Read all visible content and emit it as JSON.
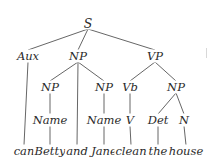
{
  "diagram": {
    "type": "syntax-tree",
    "sentence": "can Betty and Jane clean the house",
    "nodes": [
      {
        "id": "S",
        "label": "S",
        "x": 88,
        "y": 23,
        "kind": "root"
      },
      {
        "id": "Aux",
        "label": "Aux",
        "x": 28,
        "y": 56,
        "kind": "category"
      },
      {
        "id": "NP1",
        "label": "NP",
        "x": 78,
        "y": 56,
        "kind": "category"
      },
      {
        "id": "VP",
        "label": "VP",
        "x": 155,
        "y": 56,
        "kind": "category"
      },
      {
        "id": "NP2",
        "label": "NP",
        "x": 50,
        "y": 87,
        "kind": "category"
      },
      {
        "id": "NP3",
        "label": "NP",
        "x": 104,
        "y": 87,
        "kind": "category"
      },
      {
        "id": "Vb",
        "label": "Vb",
        "x": 130,
        "y": 87,
        "kind": "category"
      },
      {
        "id": "NP4",
        "label": "NP",
        "x": 176,
        "y": 87,
        "kind": "category"
      },
      {
        "id": "Name1",
        "label": "Name",
        "x": 50,
        "y": 120,
        "kind": "category"
      },
      {
        "id": "Name2",
        "label": "Name",
        "x": 104,
        "y": 120,
        "kind": "category"
      },
      {
        "id": "V",
        "label": "V",
        "x": 130,
        "y": 120,
        "kind": "category"
      },
      {
        "id": "Det",
        "label": "Det",
        "x": 158,
        "y": 120,
        "kind": "category"
      },
      {
        "id": "N",
        "label": "N",
        "x": 184,
        "y": 120,
        "kind": "category"
      },
      {
        "id": "w_can",
        "label": "can",
        "x": 24,
        "y": 151,
        "kind": "word"
      },
      {
        "id": "w_betty",
        "label": "Betty",
        "x": 50,
        "y": 151,
        "kind": "word"
      },
      {
        "id": "w_and",
        "label": "and",
        "x": 77,
        "y": 151,
        "kind": "word"
      },
      {
        "id": "w_jane",
        "label": "Jane",
        "x": 104,
        "y": 151,
        "kind": "word"
      },
      {
        "id": "w_clean",
        "label": "clean",
        "x": 131,
        "y": 151,
        "kind": "word"
      },
      {
        "id": "w_the",
        "label": "the",
        "x": 158,
        "y": 151,
        "kind": "word"
      },
      {
        "id": "w_house",
        "label": "house",
        "x": 186,
        "y": 151,
        "kind": "word"
      }
    ],
    "edges": [
      {
        "from": "S",
        "to": "Aux"
      },
      {
        "from": "S",
        "to": "NP1"
      },
      {
        "from": "S",
        "to": "VP"
      },
      {
        "from": "Aux",
        "to": "w_can"
      },
      {
        "from": "NP1",
        "to": "NP2"
      },
      {
        "from": "NP1",
        "to": "w_and"
      },
      {
        "from": "NP1",
        "to": "NP3"
      },
      {
        "from": "VP",
        "to": "Vb"
      },
      {
        "from": "VP",
        "to": "NP4"
      },
      {
        "from": "NP2",
        "to": "Name1"
      },
      {
        "from": "NP3",
        "to": "Name2"
      },
      {
        "from": "Vb",
        "to": "V"
      },
      {
        "from": "NP4",
        "to": "Det"
      },
      {
        "from": "NP4",
        "to": "N"
      },
      {
        "from": "Name1",
        "to": "w_betty"
      },
      {
        "from": "Name2",
        "to": "w_jane"
      },
      {
        "from": "V",
        "to": "w_clean"
      },
      {
        "from": "Det",
        "to": "w_the"
      },
      {
        "from": "N",
        "to": "w_house"
      }
    ]
  }
}
